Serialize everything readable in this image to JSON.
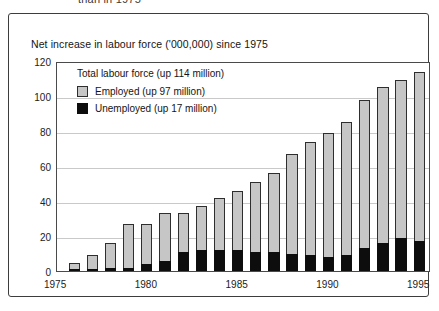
{
  "clipped_caption": "than in 1975",
  "chart_title": "Net increase in labour force ('000,000) since 1975",
  "legend": {
    "heading": "Total  labour force (up 114 million)",
    "items": [
      {
        "label": "Employed (up 97 million)",
        "swatch": "employed",
        "color": "#c6c6c6"
      },
      {
        "label": "Unemployed  (up 17 million)",
        "swatch": "unemployed",
        "color": "#0d0d0d"
      }
    ]
  },
  "chart_data": {
    "type": "bar",
    "stacked": true,
    "title": "Net increase in labour force ('000,000) since 1975",
    "xlabel": "",
    "ylabel": "",
    "ylim": [
      0,
      120
    ],
    "yticks": [
      0,
      20,
      40,
      60,
      80,
      100,
      120
    ],
    "xticks": [
      1975,
      1980,
      1985,
      1990,
      1995
    ],
    "grid": true,
    "legend_position": "inside-top-left",
    "categories": [
      1976,
      1977,
      1978,
      1979,
      1980,
      1981,
      1982,
      1983,
      1984,
      1985,
      1986,
      1987,
      1988,
      1989,
      1990,
      1991,
      1992,
      1993,
      1994,
      1995
    ],
    "series": [
      {
        "name": "Unemployed (up 17 million)",
        "color": "#0d0d0d",
        "values": [
          0.5,
          1,
          1.5,
          2,
          4,
          6,
          11,
          12,
          12,
          12,
          11,
          11,
          10,
          9,
          8,
          9,
          13,
          16,
          19,
          17
        ]
      },
      {
        "name": "Employed (up 97 million)",
        "color": "#c6c6c6",
        "values": [
          4,
          8,
          14.5,
          25,
          23,
          27,
          22,
          25,
          30,
          34,
          40,
          45,
          57,
          65,
          71,
          76,
          85,
          89,
          90,
          97
        ]
      }
    ],
    "totals": [
      4.5,
      9,
      16,
      27,
      27,
      33,
      33,
      37,
      42,
      46,
      51,
      56,
      67,
      74,
      79,
      85,
      98,
      105,
      109,
      114
    ]
  }
}
